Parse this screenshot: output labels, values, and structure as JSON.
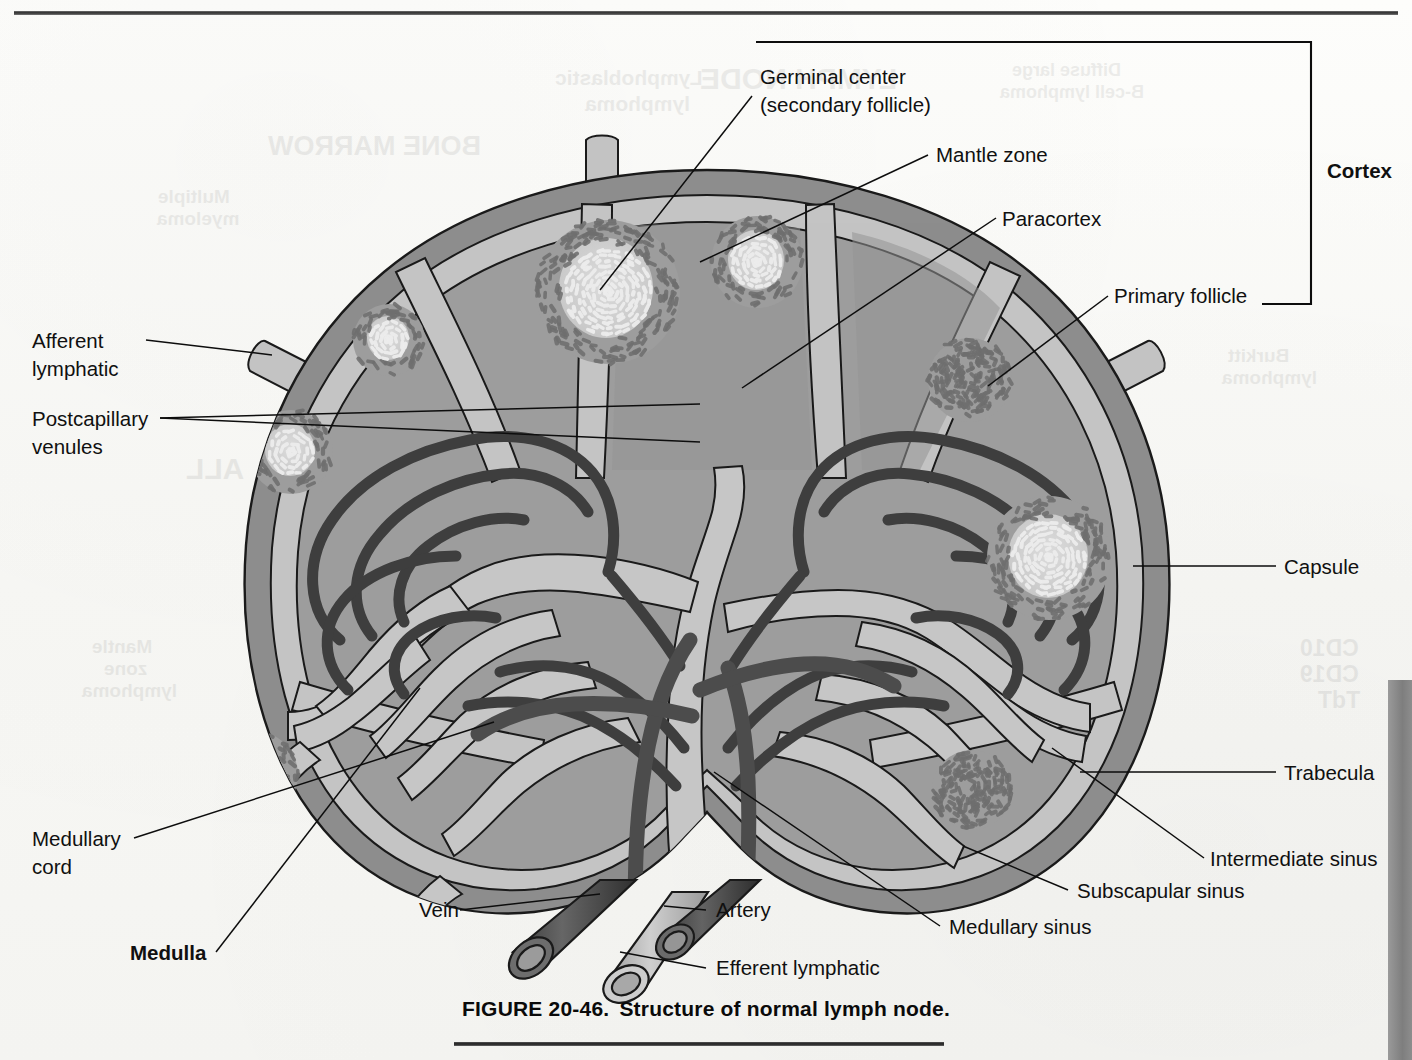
{
  "figure": {
    "number": "FIGURE 20-46.",
    "title": "Structure of normal lymph node.",
    "top_rule": true,
    "right_page_tab": true
  },
  "diagram": {
    "colors": {
      "paper": "#f7f7f4",
      "capsule": "#8d8d8d",
      "subscapular_sinus": "#c0c0c0",
      "cortex_parenchyma": "#9d9d9d",
      "paracortex": "#949494",
      "medulla_sinus": "#c5c5c5",
      "medullary_cord": "#9a9a9a",
      "vessel_dark": "#4a4a4a",
      "vein": "#555555",
      "artery": "#4f4f4f",
      "efferent_lymphatic": "#b9b9b9",
      "follicle_center": "#d4d4d4",
      "mantle_stipple": "#6e6e6e",
      "outline": "#1a1a1a",
      "label_text": "#101010",
      "page_tab": "#848484"
    }
  },
  "labels": {
    "germinal_center": {
      "line1": "Germinal center",
      "line2": "(secondary follicle)"
    },
    "mantle_zone": "Mantle zone",
    "paracortex": "Paracortex",
    "primary_follicle": "Primary follicle",
    "cortex": "Cortex",
    "capsule": "Capsule",
    "trabecula": "Trabecula",
    "intermediate_sinus": "Intermediate sinus",
    "subscapular_sinus": "Subscapular sinus",
    "medullary_sinus": "Medullary sinus",
    "afferent_lymphatic": {
      "line1": "Afferent",
      "line2": "lymphatic"
    },
    "postcapillary_venules": {
      "line1": "Postcapillary",
      "line2": "venules"
    },
    "medullary_cord": {
      "line1": "Medullary",
      "line2": "cord"
    },
    "medulla": "Medulla",
    "vein": "Vein",
    "artery": "Artery",
    "efferent_lymphatic": "Efferent lymphatic"
  },
  "ghost_text": [
    "LYMPH NODE",
    "Lymphoblastic",
    "lymphoma",
    "Diffuse large",
    "B-cell lymphoma",
    "BONE MARROW",
    "Multiple",
    "myeloma",
    "Burkitt",
    "lymphoma",
    "Mantle",
    "zone",
    "lymphoma",
    "ALL",
    "CD10",
    "CD19",
    "TdT"
  ]
}
